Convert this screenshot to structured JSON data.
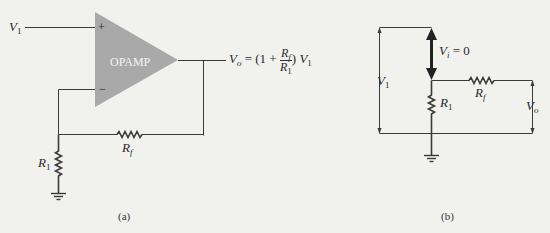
{
  "figure": {
    "panel_a": {
      "caption": "(a)",
      "opamp_label": "OPAMP",
      "input_label": {
        "base": "V",
        "sub": "1"
      },
      "plus_sign": "+",
      "minus_sign": "−",
      "output_equation": {
        "lhs_base": "V",
        "lhs_sub": "o",
        "eq": "= (1 +",
        "frac_num_base": "R",
        "frac_num_sub": "f",
        "frac_den_base": "R",
        "frac_den_sub": "1",
        "close": ")",
        "rhs_base": "V",
        "rhs_sub": "1"
      },
      "feedback_resistor": {
        "base": "R",
        "sub": "f"
      },
      "ground_resistor": {
        "base": "R",
        "sub": "1"
      }
    },
    "panel_b": {
      "caption": "(b)",
      "virtual_short": {
        "base": "V",
        "sub": "i",
        "rest": "= 0"
      },
      "input_voltage": {
        "base": "V",
        "sub": "1"
      },
      "feedback_resistor": {
        "base": "R",
        "sub": "f"
      },
      "ground_resistor": {
        "base": "R",
        "sub": "1"
      },
      "output_voltage": {
        "base": "V",
        "sub": "o"
      }
    },
    "colors": {
      "background": "#f1f1ee",
      "wire": "#3a3a3a",
      "opamp_fill": "#a9a9a9",
      "text": "#2a2a2a"
    }
  }
}
